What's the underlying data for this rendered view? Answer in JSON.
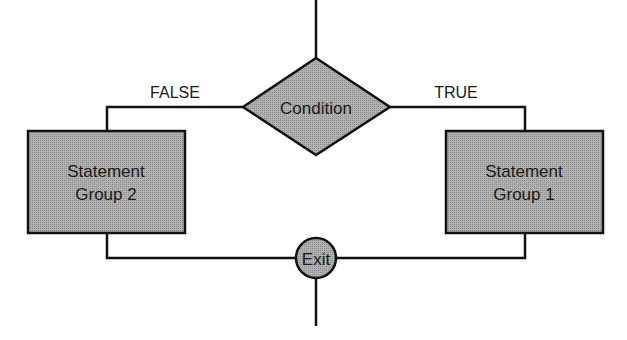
{
  "diagram": {
    "type": "flowchart",
    "colors": {
      "shape_fill": "#a9a9a9",
      "stroke": "#111111",
      "text": "#1a1a1a",
      "background": "#ffffff"
    },
    "nodes": {
      "condition": {
        "shape": "diamond",
        "label": "Condition"
      },
      "group2": {
        "shape": "rectangle",
        "line1": "Statement",
        "line2": "Group 2"
      },
      "group1": {
        "shape": "rectangle",
        "line1": "Statement",
        "line2": "Group 1"
      },
      "exit": {
        "shape": "circle",
        "label": "Exit"
      }
    },
    "edges": {
      "false_label": "FALSE",
      "true_label": "TRUE"
    }
  }
}
